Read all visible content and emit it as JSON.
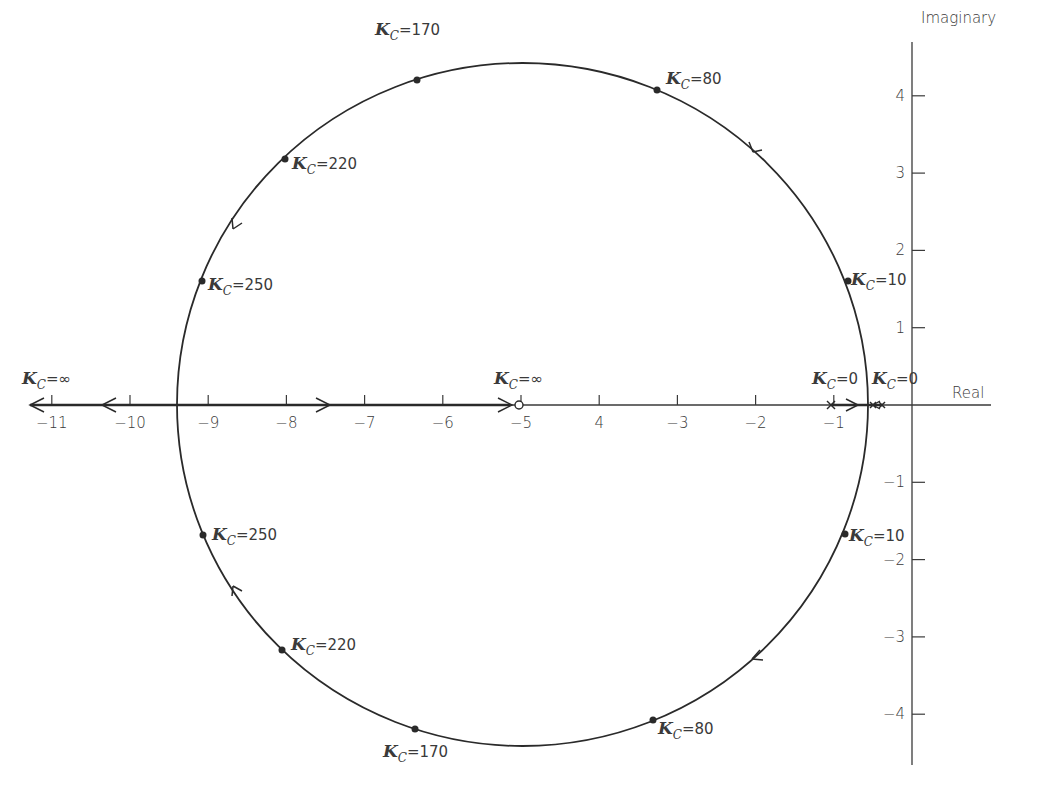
{
  "chart_data": {
    "type": "line",
    "subtype": "root-locus",
    "title": "",
    "xlabel": "Real",
    "ylabel": "Imaginary",
    "xlim": [
      -11.3,
      1
    ],
    "ylim": [
      -4.6,
      4.7
    ],
    "grid": false,
    "legend": null,
    "x_ticks": [
      {
        "value": -11,
        "label": "-11"
      },
      {
        "value": -10,
        "label": "-10"
      },
      {
        "value": -9,
        "label": "-9"
      },
      {
        "value": -8,
        "label": "-8"
      },
      {
        "value": -7,
        "label": "-7"
      },
      {
        "value": -6,
        "label": "-6"
      },
      {
        "value": -5,
        "label": "-5"
      },
      {
        "value": -4,
        "label": "4"
      },
      {
        "value": -3,
        "label": "-3"
      },
      {
        "value": -2,
        "label": "-2"
      },
      {
        "value": -1,
        "label": "-1"
      }
    ],
    "y_ticks": [
      {
        "value": 4,
        "label": "4"
      },
      {
        "value": 3,
        "label": "3"
      },
      {
        "value": 2,
        "label": "2"
      },
      {
        "value": 1,
        "label": "1"
      },
      {
        "value": -1,
        "label": "-1"
      },
      {
        "value": -2,
        "label": "-2"
      },
      {
        "value": -3,
        "label": "-3"
      },
      {
        "value": -4,
        "label": "-4"
      }
    ],
    "locus_circle": {
      "center": [
        -5,
        0
      ],
      "radius": 4.4
    },
    "open_loop_poles": [
      {
        "x": -1.0,
        "y": 0,
        "marker": "x"
      },
      {
        "x": -0.5,
        "y": 0,
        "marker": "x"
      },
      {
        "x": -0.4,
        "y": 0,
        "marker": "x"
      }
    ],
    "open_loop_zeros": [
      {
        "x": -5,
        "y": 0,
        "marker": "o"
      }
    ],
    "gain_points": [
      {
        "k": "170",
        "x": -6.3,
        "y": 4.2,
        "label": "=170"
      },
      {
        "k": "80",
        "x": -3.3,
        "y": 4.05,
        "label": "=80"
      },
      {
        "k": "220",
        "x": -8.05,
        "y": 3.2,
        "label": "=220"
      },
      {
        "k": "250",
        "x": -9.1,
        "y": 1.6,
        "label": "=250"
      },
      {
        "k": "10",
        "x": -0.8,
        "y": 1.6,
        "label": "=10"
      },
      {
        "k": "250",
        "x": -9.05,
        "y": -1.65,
        "label": "=250"
      },
      {
        "k": "220",
        "x": -8.05,
        "y": -3.15,
        "label": "=220"
      },
      {
        "k": "10",
        "x": -0.85,
        "y": -1.65,
        "label": "=10"
      },
      {
        "k": "170",
        "x": -6.45,
        "y": -4.15,
        "label": "=170"
      },
      {
        "k": "80",
        "x": -3.35,
        "y": -4.05,
        "label": "=80"
      }
    ],
    "annotations": [
      {
        "text": "K_C=∞",
        "x": -11.2,
        "y": 0.3,
        "note": "asymptote toward -∞"
      },
      {
        "text": "K_C=∞",
        "x": -5.3,
        "y": 0.3,
        "note": "at zero -5"
      },
      {
        "text": "K_C=0",
        "x": -1.2,
        "y": 0.3,
        "note": "at pole -1"
      },
      {
        "text": "K_C=0",
        "x": -0.5,
        "y": 0.3,
        "note": "at poles near -0.5"
      }
    ],
    "direction_arrows": [
      {
        "segment": "real-axis",
        "x": -10.3,
        "direction": "left"
      },
      {
        "segment": "real-axis",
        "x": -11.3,
        "direction": "left"
      },
      {
        "segment": "real-axis",
        "x": -7.5,
        "direction": "right"
      },
      {
        "segment": "real-axis",
        "x": -5.2,
        "direction": "right"
      },
      {
        "segment": "real-axis",
        "x": -0.6,
        "direction": "right"
      },
      {
        "segment": "real-axis",
        "x": -0.5,
        "direction": "left"
      },
      {
        "segment": "upper-arc",
        "at": [
          -2,
          3.3
        ],
        "direction": "counterclockwise"
      },
      {
        "segment": "upper-arc",
        "at": [
          -8.7,
          2.4
        ],
        "direction": "counterclockwise"
      },
      {
        "segment": "lower-arc",
        "at": [
          -8.7,
          -2.3
        ],
        "direction": "clockwise-up"
      },
      {
        "segment": "lower-arc",
        "at": [
          -2,
          -3.3
        ],
        "direction": "clockwise"
      }
    ]
  },
  "labels": {
    "x_axis_title": "Real",
    "y_axis_title": "Imaginary",
    "k_symbol": "K",
    "k_subscript": "C",
    "k_inf": "=∞",
    "k_zero": "=0"
  }
}
